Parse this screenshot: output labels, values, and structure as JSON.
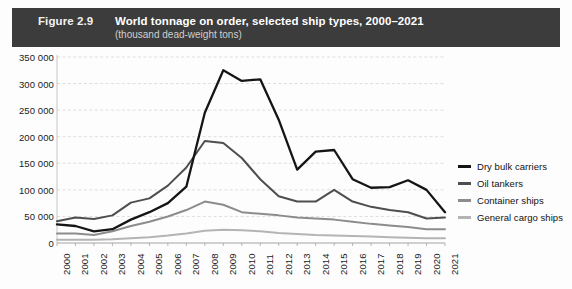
{
  "header": {
    "figure_number": "Figure 2.9",
    "title": "World tonnage on order, selected ship types, 2000–2021",
    "subtitle": "(thousand dead-weight tons)",
    "bar_color": "#3c3c3c"
  },
  "legend": {
    "position": "right",
    "items": [
      {
        "label": "Dry bulk carriers",
        "color": "#151515"
      },
      {
        "label": "Oil tankers",
        "color": "#4e4e4e"
      },
      {
        "label": "Container ships",
        "color": "#8c8c8c"
      },
      {
        "label": "General cargo ships",
        "color": "#b4b4b4"
      }
    ]
  },
  "chart_data": {
    "type": "line",
    "title": "World tonnage on order, selected ship types, 2000–2021",
    "subtitle": "(thousand dead-weight tons)",
    "xlabel": "",
    "ylabel": "thousand dead-weight tons",
    "ylim": [
      0,
      350000
    ],
    "ytick_step": 50000,
    "ytick_labels": [
      "0",
      "50 000",
      "100 000",
      "150 000",
      "200 000",
      "250 000",
      "300 000",
      "350 000"
    ],
    "ytick_values": [
      0,
      50000,
      100000,
      150000,
      200000,
      250000,
      300000,
      350000
    ],
    "grid": true,
    "grid_style": "dashed-horizontal",
    "categories": [
      "2000",
      "2001",
      "2002",
      "2003",
      "2004",
      "2005",
      "2006",
      "2007",
      "2008",
      "2009",
      "2010",
      "2011",
      "2012",
      "2013",
      "2014",
      "2015",
      "2016",
      "2017",
      "2018",
      "2019",
      "2020",
      "2021"
    ],
    "x": [
      2000,
      2001,
      2002,
      2003,
      2004,
      2005,
      2006,
      2007,
      2008,
      2009,
      2010,
      2011,
      2012,
      2013,
      2014,
      2015,
      2016,
      2017,
      2018,
      2019,
      2020,
      2021
    ],
    "series": [
      {
        "name": "Dry bulk carriers",
        "color": "#151515",
        "values": [
          35000,
          32000,
          22000,
          26000,
          44000,
          58000,
          75000,
          106000,
          245000,
          325000,
          305000,
          308000,
          232000,
          138000,
          172000,
          175000,
          120000,
          104000,
          105000,
          118000,
          100000,
          58000
        ]
      },
      {
        "name": "Oil tankers",
        "color": "#4e4e4e",
        "values": [
          41000,
          48000,
          45000,
          52000,
          76000,
          84000,
          108000,
          142000,
          192000,
          188000,
          160000,
          120000,
          88000,
          78000,
          78000,
          100000,
          78000,
          68000,
          62000,
          58000,
          46000,
          48000
        ]
      },
      {
        "name": "Container ships",
        "color": "#8c8c8c",
        "values": [
          18000,
          18000,
          15000,
          22000,
          32000,
          40000,
          50000,
          62000,
          78000,
          72000,
          58000,
          55000,
          52000,
          48000,
          46000,
          44000,
          40000,
          36000,
          33000,
          30000,
          26000,
          26000
        ]
      },
      {
        "name": "General cargo ships",
        "color": "#b4b4b4",
        "values": [
          6000,
          6000,
          6000,
          7000,
          9000,
          11000,
          14000,
          18000,
          23000,
          25000,
          24000,
          22000,
          19000,
          17000,
          15000,
          14000,
          13000,
          12000,
          11000,
          10000,
          9000,
          9000
        ]
      }
    ]
  }
}
